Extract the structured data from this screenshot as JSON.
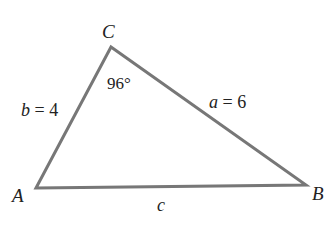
{
  "diagram": {
    "type": "triangle",
    "line_color": "#777777",
    "vertices": [
      {
        "id": "A",
        "label": "A",
        "x": 36,
        "y": 188
      },
      {
        "id": "B",
        "label": "B",
        "x": 306,
        "y": 185
      },
      {
        "id": "C",
        "label": "C",
        "x": 111,
        "y": 47
      }
    ],
    "sides": {
      "b": {
        "var": "b",
        "eq": " = 4",
        "between": [
          "A",
          "C"
        ]
      },
      "a": {
        "var": "a",
        "eq": " = 6",
        "between": [
          "C",
          "B"
        ]
      },
      "c": {
        "var": "c",
        "between": [
          "A",
          "B"
        ]
      }
    },
    "angles": {
      "C": {
        "value": "96°"
      }
    }
  }
}
